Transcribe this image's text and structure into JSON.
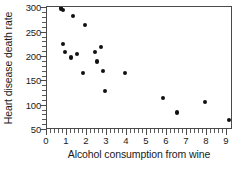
{
  "chart_data": {
    "type": "scatter",
    "title": "",
    "xlabel": "Alcohol consumption from wine",
    "ylabel": "Heart disease death rate",
    "xlim": [
      0,
      9.3
    ],
    "ylim": [
      50,
      303
    ],
    "grid": false,
    "legend": null,
    "xticks": [
      0,
      1,
      2,
      3,
      4,
      5,
      6,
      7,
      8,
      9
    ],
    "xticklabels": [
      "0",
      "1",
      "2",
      "3",
      "4",
      "5",
      "6",
      "7",
      "8",
      "9"
    ],
    "yticks": [
      50,
      100,
      150,
      200,
      250,
      300
    ],
    "yticklabels": [
      "50",
      "100",
      "150",
      "200",
      "250",
      "300"
    ],
    "x": [
      0.7,
      0.8,
      0.8,
      0.9,
      1.2,
      1.3,
      1.5,
      1.8,
      1.9,
      2.4,
      2.5,
      2.7,
      2.8,
      2.9,
      3.9,
      5.8,
      6.5,
      7.9,
      9.1
    ],
    "y": [
      300,
      297,
      227,
      211,
      199,
      284,
      207,
      167,
      266,
      211,
      191,
      220,
      172,
      131,
      167,
      115,
      86,
      108,
      71
    ],
    "marker": "circle",
    "marker_color": "#111111"
  },
  "axes": {
    "y_title": "Heart disease death rate",
    "x_title": "Alcohol consumption from wine",
    "frame_color": "#4a4a4a"
  }
}
